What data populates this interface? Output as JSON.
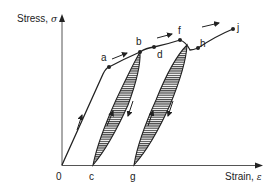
{
  "diagram": {
    "y_axis": {
      "label": "Stress, ",
      "symbol": "σ"
    },
    "x_axis": {
      "label": "Strain, ",
      "symbol": "ε"
    },
    "origin_label": "0",
    "points": {
      "a": "a",
      "b": "b",
      "c": "c",
      "d": "d",
      "f": "f",
      "g": "g",
      "h": "h",
      "j": "j"
    },
    "colors": {
      "line": "#222222",
      "hatch_fill": "#555555",
      "background": "#ffffff"
    }
  }
}
